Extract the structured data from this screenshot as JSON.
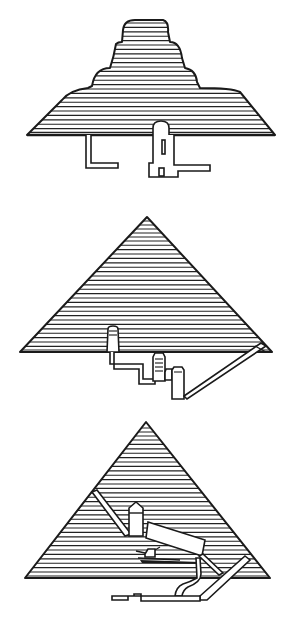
{
  "figure": {
    "type": "illustration",
    "background": "#ffffff",
    "ink_color": "#1a1a1a",
    "hatch_spacing_px": 4.4,
    "panels": [
      {
        "id": "step-pyramid",
        "shape": "stepped",
        "base_y": 135,
        "base_x": [
          27,
          275
        ],
        "tiers_top_y": [
          20,
          42,
          68,
          88
        ],
        "substructure": [
          "L-shaped descending passage (left)",
          "vertical shaft with domed top and horizontal passage (right)"
        ]
      },
      {
        "id": "middle-pyramid",
        "shape": "triangle",
        "apex": [
          147,
          217
        ],
        "base_y": 352,
        "base_x": [
          20,
          272
        ],
        "substructure": [
          "upper chamber",
          "stepped descending corridor",
          "lower chambers",
          "long diagonal entrance passage"
        ]
      },
      {
        "id": "great-pyramid",
        "shape": "triangle",
        "apex": [
          146,
          422
        ],
        "base_y": 578,
        "base_x": [
          25,
          270
        ],
        "substructure": [
          "air shaft",
          "king's chamber with relieving chambers",
          "grand gallery",
          "queen's chamber",
          "descending passage",
          "subterranean chamber"
        ]
      }
    ]
  }
}
